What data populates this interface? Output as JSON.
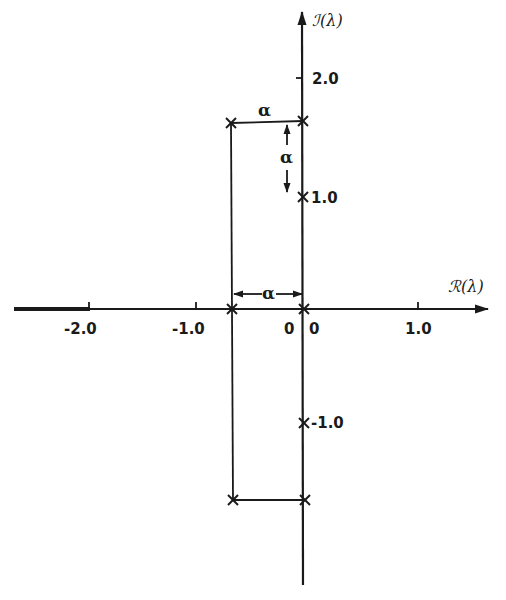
{
  "diagram": {
    "type": "complex-plane eigenvalue plot",
    "axes": {
      "real_axis_label": "ℛ(λ)",
      "imag_axis_label": "ℐ(λ)",
      "real_ticks": [
        {
          "value": -2.0,
          "label": "-2.0"
        },
        {
          "value": -1.0,
          "label": "-1.0"
        },
        {
          "value": 0,
          "label": "0"
        },
        {
          "value": 1.0,
          "label": "1.0"
        }
      ],
      "imag_ticks": [
        {
          "value": 2.0,
          "label": "2.0"
        },
        {
          "value": 1.0,
          "label": "1.0"
        },
        {
          "value": -1.0,
          "label": "-1.0"
        }
      ],
      "origin_labels": [
        "0",
        "0"
      ]
    },
    "points": [
      {
        "re": 0,
        "im": 1.57,
        "marker": "x"
      },
      {
        "re": -0.67,
        "im": 1.57,
        "marker": "x"
      },
      {
        "re": 0,
        "im": 1.0,
        "marker": "x"
      },
      {
        "re": 0,
        "im": 0,
        "marker": "x"
      },
      {
        "re": -0.67,
        "im": 0,
        "marker": "x"
      },
      {
        "re": 0,
        "im": -1.0,
        "marker": "x"
      },
      {
        "re": -0.67,
        "im": -1.6,
        "marker": "x"
      },
      {
        "re": 0,
        "im": -1.6,
        "marker": "x"
      }
    ],
    "dimensions": [
      {
        "label": "α",
        "orientation": "horizontal",
        "location": "top, between columns"
      },
      {
        "label": "α",
        "orientation": "vertical",
        "location": "from top cross down to 1.0"
      },
      {
        "label": "α",
        "orientation": "horizontal",
        "location": "above real axis, between columns"
      }
    ],
    "colors": {
      "ink": "#1a1a1a",
      "background": "#ffffff"
    }
  }
}
